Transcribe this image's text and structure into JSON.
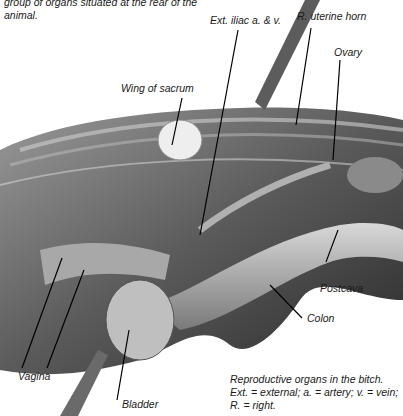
{
  "intro_text": "group of organs situated at the rear of the animal.",
  "labels": {
    "ext_iliac": "Ext. iliac a. & v.",
    "uterine_horn": "R. uterine horn",
    "ovary": "Ovary",
    "wing_sacrum": "Wing of sacrum",
    "postcava": "Postcava",
    "colon": "Colon",
    "vagina": "Vagina",
    "bladder": "Bladder"
  },
  "caption": "Reproductive organs in the bitch. Ext. = external; a. = artery; v. = vein; R. = right."
}
